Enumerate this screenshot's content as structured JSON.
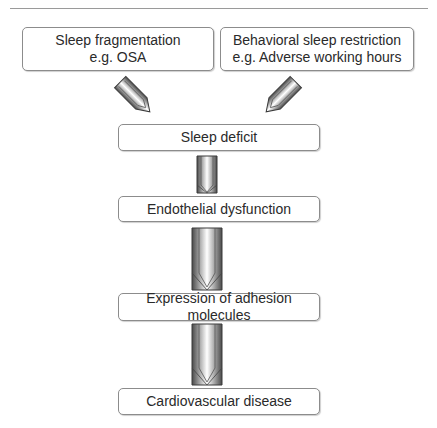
{
  "diagram": {
    "type": "flowchart",
    "nodes": [
      {
        "id": "sleep-fragmentation",
        "line1": "Sleep fragmentation",
        "line2": "e.g. OSA"
      },
      {
        "id": "behavioral-restriction",
        "line1": "Behavioral sleep restriction",
        "line2": "e.g. Adverse working hours"
      },
      {
        "id": "sleep-deficit",
        "label": "Sleep deficit"
      },
      {
        "id": "endothelial-dysfunction",
        "label": "Endothelial dysfunction"
      },
      {
        "id": "adhesion-molecules",
        "label": "Expression of adhesion molecules"
      },
      {
        "id": "cardiovascular-disease",
        "label": "Cardiovascular disease"
      }
    ],
    "edges": [
      {
        "from": "sleep-fragmentation",
        "to": "sleep-deficit"
      },
      {
        "from": "behavioral-restriction",
        "to": "sleep-deficit"
      },
      {
        "from": "sleep-deficit",
        "to": "endothelial-dysfunction"
      },
      {
        "from": "endothelial-dysfunction",
        "to": "adhesion-molecules"
      },
      {
        "from": "adhesion-molecules",
        "to": "cardiovascular-disease"
      }
    ]
  }
}
